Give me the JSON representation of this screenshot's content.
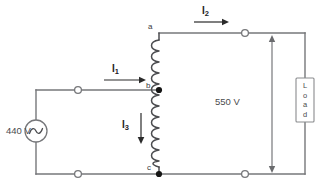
{
  "diagram": {
    "type": "autotransformer-circuit-schematic",
    "source": {
      "label": "440 V",
      "symbol": "ac-source-sine"
    },
    "output": {
      "label": "550 V",
      "symbol": "double-headed-vertical-arrow"
    },
    "load": {
      "label": "Load",
      "letters": [
        "L",
        "o",
        "a",
        "d"
      ]
    },
    "currents": [
      {
        "id": "I1",
        "base": "I",
        "sub": "1",
        "direction": "right"
      },
      {
        "id": "I2",
        "base": "I",
        "sub": "2",
        "direction": "right"
      },
      {
        "id": "I3",
        "base": "I",
        "sub": "3",
        "direction": "down"
      }
    ],
    "nodes": [
      {
        "id": "a",
        "label": "a",
        "position": "winding-top"
      },
      {
        "id": "b",
        "label": "b",
        "position": "winding-tap"
      },
      {
        "id": "c",
        "label": "c",
        "position": "winding-bottom"
      }
    ],
    "terminals": [
      {
        "id": "terminal-input-top",
        "style": "open-circle"
      },
      {
        "id": "terminal-input-bottom",
        "style": "open-circle"
      },
      {
        "id": "terminal-output-top",
        "style": "open-circle"
      },
      {
        "id": "terminal-output-bottom",
        "style": "open-circle"
      }
    ],
    "colors": {
      "wire": "#76777a",
      "coil": "#4c4d50",
      "text": "#3b3c3e",
      "arrow": "#2b2b2b",
      "background": "#ffffff"
    }
  }
}
